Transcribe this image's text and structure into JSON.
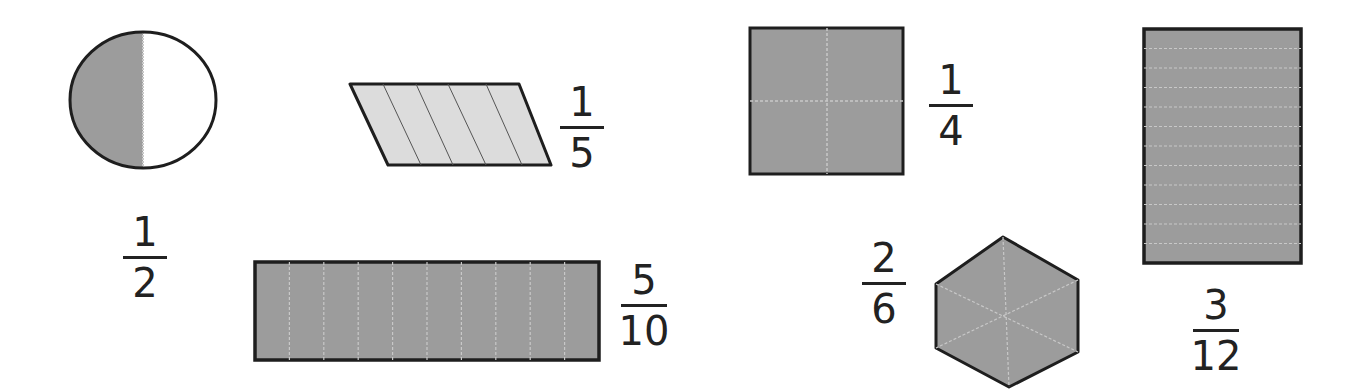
{
  "colors": {
    "shade": "#9c9c9c",
    "light_shade": "#dcdcdc",
    "outline": "#1e1e1e",
    "divider": "#c8c8c8",
    "text": "#222222"
  },
  "shapes": [
    {
      "id": "circle",
      "shape": "circle",
      "parts": 2,
      "shaded_parts": 1,
      "fraction": {
        "numerator": "1",
        "denominator": "2"
      }
    },
    {
      "id": "parallelogram",
      "shape": "parallelogram",
      "parts": 5,
      "shaded_parts": 5,
      "fraction": {
        "numerator": "1",
        "denominator": "5"
      }
    },
    {
      "id": "square",
      "shape": "square",
      "parts": 4,
      "shaded_parts": 4,
      "fraction": {
        "numerator": "1",
        "denominator": "4"
      }
    },
    {
      "id": "tall-rectangle",
      "shape": "rectangle",
      "parts": 12,
      "shaded_parts": 12,
      "fraction": {
        "numerator": "3",
        "denominator": "12"
      }
    },
    {
      "id": "wide-rectangle",
      "shape": "rectangle",
      "parts": 10,
      "shaded_parts": 10,
      "fraction": {
        "numerator": "5",
        "denominator": "10"
      }
    },
    {
      "id": "hexagon",
      "shape": "hexagon",
      "parts": 6,
      "shaded_parts": 6,
      "fraction": {
        "numerator": "2",
        "denominator": "6"
      }
    }
  ]
}
